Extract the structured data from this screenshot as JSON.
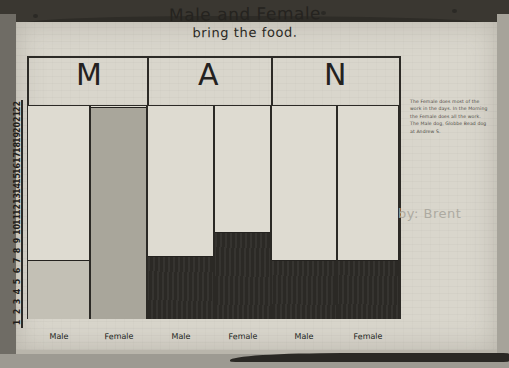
{
  "document": {
    "medium": "hand-drawn pencil-and-marker bar chart on paper",
    "title_line1": "Male and Female",
    "title_line2": "bring the food.",
    "byline": "by: Brent",
    "header_letters": [
      "M",
      "A",
      "N"
    ],
    "note_lines": [
      "The Female does most of the",
      "work in the days. In the Morning",
      "the Female does all the work.",
      "The Male dog, Globbe Bead dog",
      "at Andrew S."
    ]
  },
  "chart_data": {
    "type": "bar",
    "title": "Male and Female bring the food.",
    "subtitle": "",
    "xlabel": "",
    "ylabel": "",
    "categories": [
      "Male",
      "Female",
      "Male",
      "Female",
      "Male",
      "Female"
    ],
    "values": [
      6,
      22,
      6.5,
      9,
      6,
      6
    ],
    "bar_shades": [
      "light",
      "mid",
      "dark",
      "dark",
      "dark",
      "dark"
    ],
    "ylim": [
      0,
      22
    ],
    "yticks": [
      22,
      21,
      20,
      19,
      18,
      17,
      16,
      15,
      14,
      13,
      12,
      11,
      10,
      9,
      8,
      7,
      6,
      5,
      4,
      3,
      2,
      1
    ],
    "grid": false,
    "legend": "none",
    "groups": [
      "M",
      "A",
      "N"
    ]
  },
  "colors": {
    "paper": "#d9d6cc",
    "ink": "#2b2925",
    "fill_light": "#c3c0b5",
    "fill_mid": "#a9a69b",
    "fill_dark": "#2b2925",
    "byline_pencil": "#adaaa1"
  }
}
